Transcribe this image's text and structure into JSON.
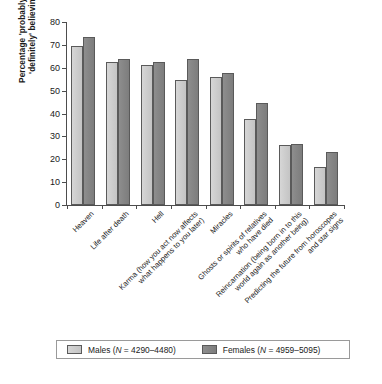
{
  "chart_data": {
    "type": "bar",
    "title": "",
    "xlabel": "",
    "ylabel_line1": "Percentage 'probably' or",
    "ylabel_line2": "'definitely' believing",
    "ylim": [
      0,
      80
    ],
    "yticks": [
      0,
      10,
      20,
      30,
      40,
      50,
      60,
      70,
      80
    ],
    "grid": false,
    "legend_position": "bottom",
    "categories": [
      "Heaven",
      "Life after death",
      "Karma (how you act now affects what happens to you later)",
      "Hell",
      "Miracles",
      "Ghosts or spirits of relatives who have died",
      "Reincarnation (being born in to this world again as another being)",
      "Predicting the future from horoscopes and star signs"
    ],
    "category_lines": [
      [
        "Heaven"
      ],
      [
        "Life after death"
      ],
      [
        "Hell"
      ],
      [
        "Karma (how you act now affects",
        "what happens to you later)"
      ],
      [
        "Miracles"
      ],
      [
        "Ghosts or spirits of relatives",
        "who have died"
      ],
      [
        "Reincarnation (being born in to this",
        "world again as another being)"
      ],
      [
        "Predicting the future from horoscopes",
        "and star signs"
      ]
    ],
    "series": [
      {
        "name": "Males",
        "legend_label": "Males (N = 4290–4480)",
        "color": "#cccccc",
        "values": [
          69.5,
          62.7,
          61.0,
          54.5,
          56.0,
          37.8,
          26.3,
          16.8
        ]
      },
      {
        "name": "Females",
        "legend_label": "Females (N = 4959–5095)",
        "color": "#858585",
        "values": [
          73.5,
          64.0,
          62.7,
          64.0,
          57.7,
          44.8,
          26.7,
          23.0
        ]
      }
    ]
  },
  "legend": {
    "males_label": "Males (",
    "males_n": "N",
    "males_value": " = 4290–4480)",
    "females_label": "Females (",
    "females_n": "N",
    "females_value": " = 4959–5095)"
  },
  "caption": {
    "ghost_text": ""
  }
}
